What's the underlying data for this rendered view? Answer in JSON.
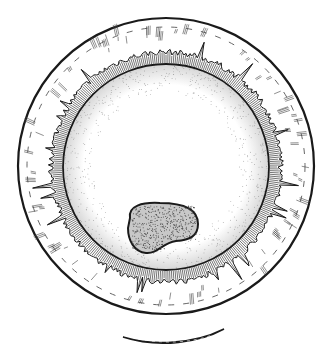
{
  "illustration": {
    "subject": "egg cell drawing",
    "style": "black ink line drawing with stippling",
    "parts": [
      {
        "id": "outer-shell",
        "description": "outer circular envelope"
      },
      {
        "id": "radiating-layer",
        "description": "striated radial layer between shell and membrane"
      },
      {
        "id": "inner-membrane",
        "description": "inner circular membrane with stippled cytoplasm"
      },
      {
        "id": "nucleus",
        "description": "dark stippled kidney-shaped body"
      },
      {
        "id": "crescent",
        "description": "dark crescent mark below the cell"
      }
    ]
  },
  "colors": {
    "ink": "#1a1a1a",
    "stipple": "#444444",
    "paper": "#ffffff"
  }
}
